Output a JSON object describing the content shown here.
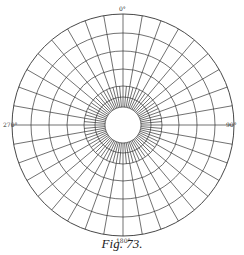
{
  "figure": {
    "caption": "Fig. 73.",
    "center": {
      "x": 123,
      "y": 125
    },
    "outer_radius": 111,
    "inner_radius": 18,
    "rings": [
      111,
      92,
      74,
      56,
      39,
      28,
      18
    ],
    "outer_spoke_step_deg": 10,
    "inner_spoke_step_deg": 5,
    "inner_spoke_region": [
      18,
      39
    ],
    "stroke_color": "#333333",
    "labels": {
      "top": "0°",
      "right": "90°",
      "bottom": "180°",
      "left": "270°"
    }
  }
}
